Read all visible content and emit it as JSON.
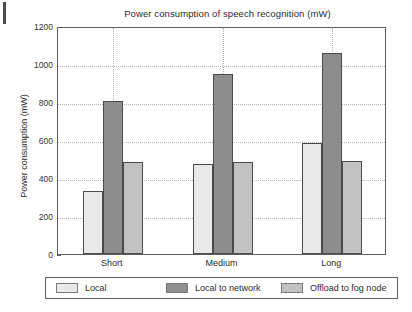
{
  "chart_data": {
    "type": "bar",
    "title": "Power consumption of speech recognition (mW)",
    "xlabel": "",
    "ylabel": "Power consumption (mW)",
    "categories": [
      "Short",
      "Medium",
      "Long"
    ],
    "series": [
      {
        "name": "Local",
        "values": [
          330,
          475,
          583
        ],
        "color": "#e9e9e9"
      },
      {
        "name": "Local to network",
        "values": [
          805,
          950,
          1060
        ],
        "color": "#8e8e8e"
      },
      {
        "name": "Offload to fog node",
        "values": [
          482,
          484,
          487
        ],
        "color": "#c2c2c2"
      }
    ],
    "ylim": [
      0,
      1200
    ],
    "yticks": [
      0,
      200,
      400,
      600,
      800,
      1000,
      1200
    ],
    "ytick_labels": [
      "0",
      "200",
      "400",
      "600",
      "800",
      "1000",
      "1200"
    ],
    "grid": true,
    "legend_position": "bottom"
  },
  "legend": {
    "items": [
      {
        "label": "Local",
        "swatch": "legend-swatch-local"
      },
      {
        "label": "Local to network",
        "swatch": "legend-swatch-local-to-network"
      },
      {
        "label": "Offload to fog node",
        "swatch": "legend-swatch-offload-to-fog-node"
      }
    ]
  }
}
